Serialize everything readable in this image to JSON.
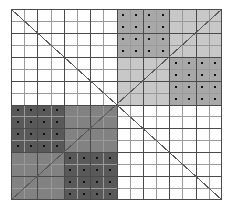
{
  "figure": {
    "width": 233,
    "height": 214,
    "background_color": "#ffffff"
  },
  "grid": {
    "origin_x": 11,
    "origin_y": 9,
    "width": 211,
    "height": 191,
    "minor_divisions": 16,
    "major_divisions": 8,
    "minor_line_color": "#9a9a9a",
    "major_line_color": "#4a4a4a",
    "border_color": "#4a4a4a",
    "minor_line_width": 1,
    "major_line_width": 1
  },
  "palette": {
    "white": "#ffffff",
    "light_gray": "#c8c8c8",
    "medium_gray": "#a8a8a8",
    "mid_dark_gray": "#828282",
    "dark_gray": "#595959",
    "dot_color": "#101010",
    "diagonal_color": "#5a5a5a"
  },
  "diagonals": [
    {
      "name": "main-diagonal",
      "from": "top-left",
      "to": "bottom-right",
      "x1": 0,
      "y1": 0,
      "x2": 211,
      "y2": 191,
      "color": "#5a5a5a",
      "width": 1
    },
    {
      "name": "anti-diagonal",
      "from": "bottom-left",
      "to": "top-right",
      "x1": 0,
      "y1": 191,
      "x2": 211,
      "y2": 0,
      "color": "#5a5a5a",
      "width": 1
    }
  ],
  "quadrants": [
    {
      "name": "top-left-quadrant",
      "position": "top-left",
      "col_start": 0,
      "row_start": 0,
      "col_span": 8,
      "row_span": 8,
      "fill": "#ffffff",
      "dotted": false,
      "label": "Top-left quadrant (empty / white)"
    },
    {
      "name": "top-right-quadrant",
      "position": "top-right",
      "col_start": 8,
      "row_start": 0,
      "col_span": 8,
      "row_span": 8,
      "fill": "#c8c8c8",
      "dotted": false,
      "label": "Top-right quadrant (light gray)"
    },
    {
      "name": "bottom-left-quadrant",
      "position": "bottom-left",
      "col_start": 0,
      "row_start": 8,
      "col_span": 8,
      "row_span": 8,
      "fill": "#828282",
      "dotted": false,
      "label": "Bottom-left quadrant (mid dark gray)"
    },
    {
      "name": "bottom-right-quadrant",
      "position": "bottom-right",
      "col_start": 8,
      "row_start": 8,
      "col_span": 8,
      "row_span": 8,
      "fill": "#ffffff",
      "dotted": false,
      "label": "Bottom-right quadrant (empty / white)"
    }
  ],
  "subblocks": [
    {
      "name": "top-right-upper-left-subblock",
      "parent": "top-right-quadrant",
      "col_start": 8,
      "row_start": 0,
      "col_span": 4,
      "row_span": 4,
      "fill": "#a8a8a8",
      "dotted": true,
      "dot_count": 16,
      "label": "Dotted sub-block, top-right quadrant upper-left"
    },
    {
      "name": "top-right-lower-right-subblock",
      "parent": "top-right-quadrant",
      "col_start": 12,
      "row_start": 4,
      "col_span": 4,
      "row_span": 4,
      "fill": "#a8a8a8",
      "dotted": true,
      "dot_count": 16,
      "label": "Dotted sub-block, top-right quadrant lower-right"
    },
    {
      "name": "bottom-left-upper-left-subblock",
      "parent": "bottom-left-quadrant",
      "col_start": 0,
      "row_start": 8,
      "col_span": 4,
      "row_span": 4,
      "fill": "#595959",
      "dotted": true,
      "dot_count": 16,
      "label": "Dotted sub-block, bottom-left quadrant upper-left"
    },
    {
      "name": "bottom-left-lower-right-subblock",
      "parent": "bottom-left-quadrant",
      "col_start": 4,
      "row_start": 12,
      "col_span": 4,
      "row_span": 4,
      "fill": "#595959",
      "dotted": true,
      "dot_count": 16,
      "label": "Dotted sub-block, bottom-left quadrant lower-right"
    }
  ]
}
